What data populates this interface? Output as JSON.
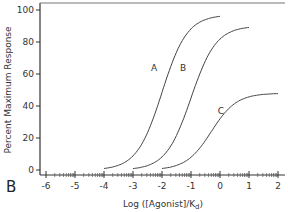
{
  "chart_data": {
    "type": "line",
    "title": "",
    "panel_label": "B",
    "xlabel": "Log ([Agonist]/K",
    "xlabel_sub": "d",
    "xlabel_close": ")",
    "ylabel": "Percent Maximum Response",
    "xlim": [
      -6.3,
      2.1
    ],
    "ylim": [
      -3,
      103
    ],
    "x_ticks": [
      -6,
      -5,
      -4,
      -3,
      -2,
      -1,
      0,
      1,
      2
    ],
    "x_tick_labels": [
      "-6",
      "-5",
      "-4",
      "-3",
      "-2",
      "-1",
      "0",
      "1",
      "2"
    ],
    "y_ticks": [
      0,
      20,
      40,
      60,
      80,
      100
    ],
    "y_tick_labels": [
      "0",
      "20",
      "40",
      "60",
      "80",
      "100"
    ],
    "x_scale_minor": "log-decade minor ticks",
    "grid": false,
    "legend": "none (curves labeled inline)",
    "series": [
      {
        "name": "A",
        "model": "logistic",
        "max": 97,
        "log_ec50": -2.0,
        "x_range": [
          -4,
          0
        ],
        "x": [
          -4,
          -3.5,
          -3,
          -2.5,
          -2,
          -1.5,
          -1,
          -0.5,
          0
        ],
        "values": [
          1,
          3,
          9,
          23,
          48,
          73,
          88,
          94,
          96
        ],
        "label_pos": {
          "x": -2.2,
          "y": 64
        }
      },
      {
        "name": "B",
        "model": "logistic",
        "max": 90,
        "log_ec50": -1.0,
        "x_range": [
          -3,
          1
        ],
        "x": [
          -3,
          -2.5,
          -2,
          -1.5,
          -1,
          -0.5,
          0,
          0.5,
          1
        ],
        "values": [
          1,
          3,
          8,
          21,
          45,
          68,
          82,
          87,
          89
        ],
        "label_pos": {
          "x": -1.2,
          "y": 64
        }
      },
      {
        "name": "C",
        "model": "logistic",
        "max": 48,
        "log_ec50": -0.3,
        "x_range": [
          -2,
          2
        ],
        "x": [
          -2,
          -1.5,
          -1,
          -0.5,
          0,
          0.5,
          1,
          1.5,
          2
        ],
        "values": [
          1,
          2,
          7,
          15,
          28,
          40,
          45,
          47,
          48
        ],
        "label_pos": {
          "x": 0.1,
          "y": 37
        }
      }
    ]
  }
}
